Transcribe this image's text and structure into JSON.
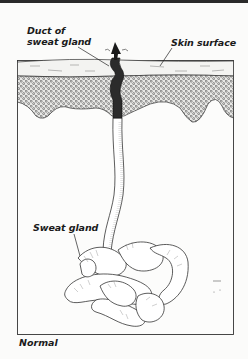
{
  "figure": {
    "labels": {
      "duct_line1": "Duct of",
      "duct_line2": "sweat gland",
      "skin_surface": "Skin surface",
      "sweat_gland": "Sweat gland"
    },
    "caption": "Normal"
  },
  "colors": {
    "ink": "#1a1a1a",
    "paper": "#fbfbfa",
    "duct": "#2b2b2b",
    "stipple": "#555555"
  }
}
